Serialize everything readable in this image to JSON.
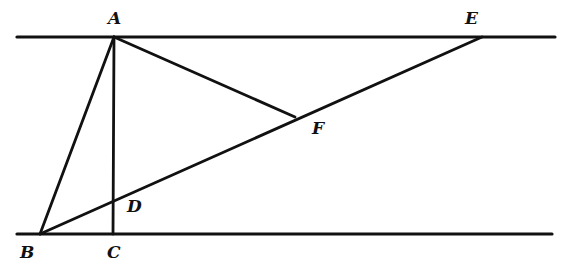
{
  "diagram": {
    "type": "geometry",
    "stroke_color": "#111111",
    "background": "#ffffff",
    "points": {
      "A": {
        "x": 114,
        "y": 37
      },
      "B": {
        "x": 40,
        "y": 234
      },
      "C": {
        "x": 113,
        "y": 234
      },
      "D": {
        "x": 113,
        "y": 201
      },
      "E": {
        "x": 482,
        "y": 37
      },
      "F": {
        "x": 295,
        "y": 117
      }
    },
    "labels": {
      "A": {
        "text": "A",
        "x": 108,
        "y": 24
      },
      "B": {
        "text": "B",
        "x": 20,
        "y": 258
      },
      "C": {
        "text": "C",
        "x": 107,
        "y": 258
      },
      "D": {
        "text": "D",
        "x": 127,
        "y": 212
      },
      "E": {
        "text": "E",
        "x": 465,
        "y": 24
      },
      "F": {
        "text": "F",
        "x": 312,
        "y": 134
      }
    },
    "parallel_lines": [
      {
        "name": "top-line",
        "x1": 17,
        "y1": 37,
        "x2": 555,
        "y2": 37
      },
      {
        "name": "bottom-line",
        "x1": 17,
        "y1": 234,
        "x2": 552,
        "y2": 234
      }
    ],
    "segments": [
      {
        "name": "segment-AB",
        "from": "A",
        "to": "B"
      },
      {
        "name": "segment-AC",
        "from": "A",
        "to": "C"
      },
      {
        "name": "segment-AF",
        "from": "A",
        "to": "F"
      },
      {
        "name": "segment-BE",
        "from": "B",
        "to": "E"
      }
    ]
  }
}
